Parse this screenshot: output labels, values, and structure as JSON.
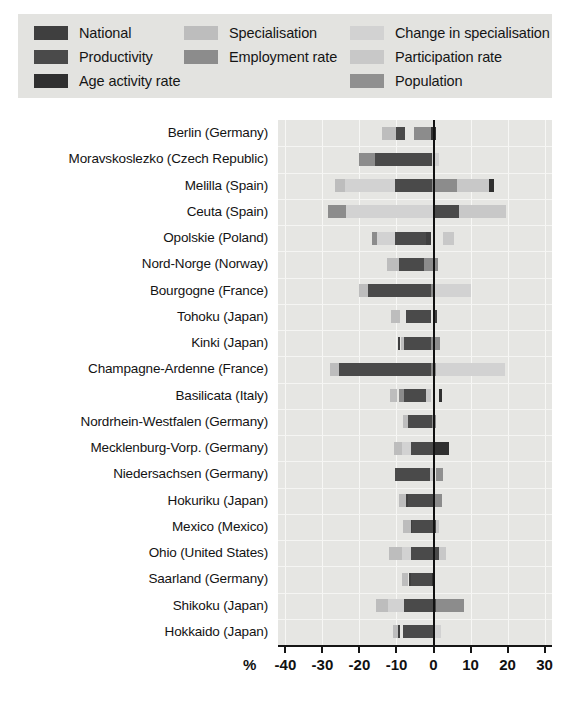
{
  "legend": {
    "rows": [
      [
        {
          "label": "National",
          "color": "#3f3f3f",
          "key": "national"
        },
        {
          "label": "Specialisation",
          "color": "#bdbdbd",
          "key": "specialisation"
        },
        {
          "label": "Change in specialisation",
          "color": "#d2d2d2",
          "key": "change_in_specialisation"
        }
      ],
      [
        {
          "label": "Productivity",
          "color": "#4a4a4a",
          "key": "productivity"
        },
        {
          "label": "Employment rate",
          "color": "#8c8c8c",
          "key": "employment_rate"
        },
        {
          "label": "Participation rate",
          "color": "#c8c8c8",
          "key": "participation_rate"
        }
      ],
      [
        {
          "label": "Age activity rate",
          "color": "#303030",
          "key": "age_activity_rate"
        },
        {
          "label": "",
          "color": "#8c8c8c",
          "key": "blank"
        },
        {
          "label": "Population",
          "color": "#909090",
          "key": "population"
        }
      ]
    ]
  },
  "axis": {
    "unit_label": "%",
    "ticks": [
      -40,
      -30,
      -20,
      -10,
      0,
      10,
      20,
      30
    ],
    "tick_labels": [
      "-40",
      "-30",
      "-20",
      "-10",
      "0",
      "10",
      "20",
      "30"
    ],
    "min": -42,
    "max": 32
  },
  "chart_data": {
    "type": "bar",
    "orientation": "horizontal",
    "stacked": true,
    "title": "",
    "xlabel": "%",
    "ylabel": "",
    "xlim": [
      -42,
      32
    ],
    "grid": true,
    "legend_position": "top",
    "series_colors": {
      "national": "#3f3f3f",
      "productivity": "#4a4a4a",
      "age_activity_rate": "#303030",
      "specialisation": "#bdbdbd",
      "employment_rate": "#8c8c8c",
      "change_in_specialisation": "#d2d2d2",
      "participation_rate": "#c8c8c8",
      "population": "#909090"
    },
    "categories": [
      "Berlin (Germany)",
      "Moravskoslezko (Czech Republic)",
      "Melilla  (Spain)",
      "Ceuta (Spain)",
      "Opolskie (Poland)",
      "Nord-Norge (Norway)",
      "Bourgogne (France)",
      "Tohoku (Japan)",
      "Kinki (Japan)",
      "Champagne-Ardenne (France)",
      "Basilicata (Italy)",
      "Nordrhein-Westfalen (Germany)",
      "Mecklenburg-Vorp. (Germany)",
      "Niedersachsen (Germany)",
      "Hokuriku (Japan)",
      "Mexico (Mexico)",
      "Ohio (United States)",
      "Saarland (Germany)",
      "Shikoku (Japan)",
      "Hokkaido (Japan)"
    ],
    "rows": [
      {
        "category": "Berlin (Germany)",
        "segments": [
          {
            "key": "specialisation",
            "start": -13.9,
            "end": -10.0
          },
          {
            "key": "productivity",
            "start": -10.0,
            "end": -7.6
          },
          {
            "key": "employment_rate",
            "start": -5.2,
            "end": -0.8
          },
          {
            "key": "age_activity_rate",
            "start": -0.8,
            "end": 0.6
          }
        ]
      },
      {
        "category": "Moravskoslezko (Czech Republic)",
        "segments": [
          {
            "key": "employment_rate",
            "start": -20.0,
            "end": -15.9
          },
          {
            "key": "productivity",
            "start": -15.9,
            "end": -0.5
          },
          {
            "key": "change_in_specialisation",
            "start": -0.5,
            "end": 1.6
          }
        ]
      },
      {
        "category": "Melilla  (Spain)",
        "segments": [
          {
            "key": "specialisation",
            "start": -26.6,
            "end": -24.0
          },
          {
            "key": "change_in_specialisation",
            "start": -24.0,
            "end": -10.4
          },
          {
            "key": "productivity",
            "start": -10.4,
            "end": -0.4
          },
          {
            "key": "employment_rate",
            "start": -0.4,
            "end": 6.4
          },
          {
            "key": "participation_rate",
            "start": 6.4,
            "end": 15.0
          },
          {
            "key": "age_activity_rate",
            "start": 15.0,
            "end": 16.4
          }
        ]
      },
      {
        "category": "Ceuta (Spain)",
        "segments": [
          {
            "key": "employment_rate",
            "start": -28.4,
            "end": -23.6
          },
          {
            "key": "change_in_specialisation",
            "start": -23.6,
            "end": -0.2
          },
          {
            "key": "productivity",
            "start": 0.2,
            "end": 7.0
          },
          {
            "key": "participation_rate",
            "start": 7.0,
            "end": 19.6
          }
        ]
      },
      {
        "category": "Opolskie (Poland)",
        "segments": [
          {
            "key": "employment_rate",
            "start": -16.5,
            "end": -15.2
          },
          {
            "key": "change_in_specialisation",
            "start": -15.2,
            "end": -10.4
          },
          {
            "key": "productivity",
            "start": -10.4,
            "end": -2.0
          },
          {
            "key": "national",
            "start": -2.0,
            "end": -0.8
          },
          {
            "key": "participation_rate",
            "start": 2.6,
            "end": 5.6
          }
        ]
      },
      {
        "category": "Nord-Norge (Norway)",
        "segments": [
          {
            "key": "specialisation",
            "start": -12.6,
            "end": -9.4
          },
          {
            "key": "productivity",
            "start": -9.4,
            "end": -2.6
          },
          {
            "key": "employment_rate",
            "start": -2.6,
            "end": 1.2
          }
        ]
      },
      {
        "category": "Bourgogne (France)",
        "segments": [
          {
            "key": "specialisation",
            "start": -20.2,
            "end": -17.6
          },
          {
            "key": "productivity",
            "start": -17.6,
            "end": -0.8
          },
          {
            "key": "employment_rate",
            "start": -0.8,
            "end": 0.4
          },
          {
            "key": "change_in_specialisation",
            "start": 0.4,
            "end": 10.2
          }
        ]
      },
      {
        "category": "Tohoku (Japan)",
        "segments": [
          {
            "key": "specialisation",
            "start": -11.4,
            "end": -9.0
          },
          {
            "key": "productivity",
            "start": -7.4,
            "end": -0.6
          },
          {
            "key": "national",
            "start": 0.2,
            "end": 1.0
          }
        ]
      },
      {
        "category": "Kinki (Japan)",
        "segments": [
          {
            "key": "national",
            "start": -9.6,
            "end": -9.0
          },
          {
            "key": "specialisation",
            "start": -8.8,
            "end": -8.0
          },
          {
            "key": "productivity",
            "start": -8.0,
            "end": -0.6
          },
          {
            "key": "employment_rate",
            "start": -0.6,
            "end": 1.8
          }
        ]
      },
      {
        "category": "Champagne-Ardenne (France)",
        "segments": [
          {
            "key": "specialisation",
            "start": -28.0,
            "end": -25.6
          },
          {
            "key": "productivity",
            "start": -25.6,
            "end": -0.8
          },
          {
            "key": "employment_rate",
            "start": -0.8,
            "end": 0.6
          },
          {
            "key": "change_in_specialisation",
            "start": 0.6,
            "end": 19.2
          }
        ]
      },
      {
        "category": "Basilicata (Italy)",
        "segments": [
          {
            "key": "specialisation",
            "start": -11.8,
            "end": -9.8
          },
          {
            "key": "employment_rate",
            "start": -9.4,
            "end": -8.0
          },
          {
            "key": "productivity",
            "start": -8.0,
            "end": -2.0
          },
          {
            "key": "participation_rate",
            "start": -2.0,
            "end": -0.6
          },
          {
            "key": "age_activity_rate",
            "start": 1.4,
            "end": 2.2
          }
        ]
      },
      {
        "category": "Nordrhein-Westfalen (Germany)",
        "segments": [
          {
            "key": "specialisation",
            "start": -8.2,
            "end": -6.8
          },
          {
            "key": "productivity",
            "start": -6.8,
            "end": -0.4
          },
          {
            "key": "employment_rate",
            "start": -0.4,
            "end": 0.6
          }
        ]
      },
      {
        "category": "Mecklenburg-Vorp. (Germany)",
        "segments": [
          {
            "key": "specialisation",
            "start": -10.6,
            "end": -8.6
          },
          {
            "key": "change_in_specialisation",
            "start": -8.6,
            "end": -6.2
          },
          {
            "key": "productivity",
            "start": -6.2,
            "end": 0.0
          },
          {
            "key": "age_activity_rate",
            "start": 0.0,
            "end": 4.2
          }
        ]
      },
      {
        "category": "Niedersachsen (Germany)",
        "segments": [
          {
            "key": "productivity",
            "start": -10.4,
            "end": -1.0
          },
          {
            "key": "participation_rate",
            "start": -1.0,
            "end": 0.2
          },
          {
            "key": "population",
            "start": 0.8,
            "end": 2.6
          }
        ]
      },
      {
        "category": "Hokuriku (Japan)",
        "segments": [
          {
            "key": "specialisation",
            "start": -9.4,
            "end": -7.4
          },
          {
            "key": "national",
            "start": -7.4,
            "end": -7.0
          },
          {
            "key": "productivity",
            "start": -7.0,
            "end": 0.4
          },
          {
            "key": "employment_rate",
            "start": 0.4,
            "end": 2.4
          }
        ]
      },
      {
        "category": "Mexico (Mexico)",
        "segments": [
          {
            "key": "specialisation",
            "start": -8.2,
            "end": -6.2
          },
          {
            "key": "national",
            "start": -6.2,
            "end": -5.8
          },
          {
            "key": "productivity",
            "start": -5.8,
            "end": 0.6
          },
          {
            "key": "participation_rate",
            "start": 0.6,
            "end": 1.6
          }
        ]
      },
      {
        "category": "Ohio (United States)",
        "segments": [
          {
            "key": "specialisation",
            "start": -12.0,
            "end": -8.4
          },
          {
            "key": "change_in_specialisation",
            "start": -8.4,
            "end": -6.0
          },
          {
            "key": "productivity",
            "start": -6.0,
            "end": 1.6
          },
          {
            "key": "participation_rate",
            "start": 1.6,
            "end": 3.4
          }
        ]
      },
      {
        "category": "Saarland (Germany)",
        "segments": [
          {
            "key": "specialisation",
            "start": -8.6,
            "end": -6.8
          },
          {
            "key": "national",
            "start": -6.6,
            "end": -6.2
          },
          {
            "key": "productivity",
            "start": -6.2,
            "end": -0.4
          },
          {
            "key": "age_activity_rate",
            "start": -0.4,
            "end": 0.4
          }
        ]
      },
      {
        "category": "Shikoku (Japan)",
        "segments": [
          {
            "key": "specialisation",
            "start": -15.6,
            "end": -12.4
          },
          {
            "key": "change_in_specialisation",
            "start": -12.4,
            "end": -8.0
          },
          {
            "key": "productivity",
            "start": -8.0,
            "end": 0.8
          },
          {
            "key": "employment_rate",
            "start": 0.8,
            "end": 8.2
          }
        ]
      },
      {
        "category": "Hokkaido (Japan)",
        "segments": [
          {
            "key": "specialisation",
            "start": -11.0,
            "end": -9.6
          },
          {
            "key": "national",
            "start": -9.6,
            "end": -9.0
          },
          {
            "key": "productivity",
            "start": -8.2,
            "end": -0.2
          },
          {
            "key": "change_in_specialisation",
            "start": -0.2,
            "end": 2.0
          }
        ]
      }
    ]
  }
}
